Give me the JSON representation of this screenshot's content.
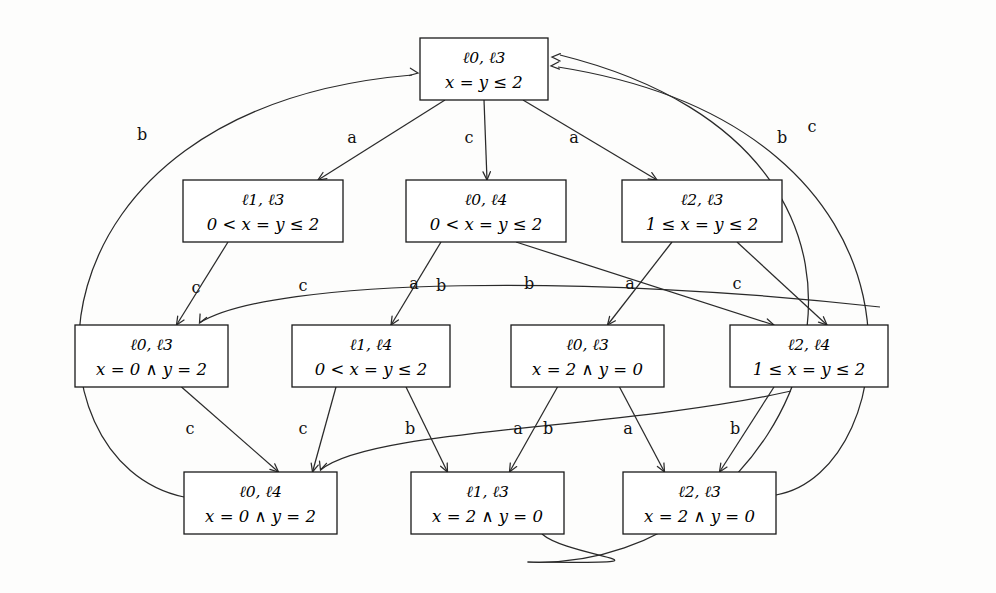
{
  "diagram": {
    "colors": {
      "line": "#2a2a2a",
      "box_stroke": "#1a1a1a",
      "background": "#ffffff",
      "text": "#000000"
    },
    "nodes": [
      {
        "id": "n0",
        "locations": "ℓ0, ℓ3",
        "constraint": "x = y ≤ 2",
        "x": 420,
        "y": 38,
        "w": 128,
        "h": 62
      },
      {
        "id": "n1",
        "locations": "ℓ1, ℓ3",
        "constraint": "0 < x = y ≤ 2",
        "x": 183,
        "y": 180,
        "w": 160,
        "h": 62
      },
      {
        "id": "n2",
        "locations": "ℓ0, ℓ4",
        "constraint": "0 < x = y ≤ 2",
        "x": 406,
        "y": 180,
        "w": 160,
        "h": 62
      },
      {
        "id": "n3",
        "locations": "ℓ2, ℓ3",
        "constraint": "1 ≤ x = y ≤ 2",
        "x": 622,
        "y": 180,
        "w": 160,
        "h": 62
      },
      {
        "id": "n4",
        "locations": "ℓ0, ℓ3",
        "constraint": "x = 0 ∧ y = 2",
        "x": 75,
        "y": 325,
        "w": 153,
        "h": 62
      },
      {
        "id": "n5",
        "locations": "ℓ1, ℓ4",
        "constraint": "0 < x = y ≤ 2",
        "x": 292,
        "y": 325,
        "w": 158,
        "h": 62
      },
      {
        "id": "n6",
        "locations": "ℓ0, ℓ3",
        "constraint": "x = 2 ∧ y = 0",
        "x": 511,
        "y": 325,
        "w": 153,
        "h": 62
      },
      {
        "id": "n7",
        "locations": "ℓ2, ℓ4",
        "constraint": "1 ≤ x = y ≤ 2",
        "x": 730,
        "y": 325,
        "w": 158,
        "h": 62
      },
      {
        "id": "n8",
        "locations": "ℓ0, ℓ4",
        "constraint": "x = 0 ∧ y = 2",
        "x": 184,
        "y": 472,
        "w": 153,
        "h": 62
      },
      {
        "id": "n9",
        "locations": "ℓ1, ℓ3",
        "constraint": "x = 2 ∧ y = 0",
        "x": 411,
        "y": 472,
        "w": 153,
        "h": 62
      },
      {
        "id": "n10",
        "locations": "ℓ2, ℓ3",
        "constraint": "x = 2 ∧ y = 0",
        "x": 623,
        "y": 472,
        "w": 153,
        "h": 62
      }
    ],
    "edge_labels": [
      {
        "id": "e_left_b",
        "label": "b",
        "x": 142,
        "y": 140
      },
      {
        "id": "e_n0_n1_a",
        "label": "a",
        "x": 352,
        "y": 143
      },
      {
        "id": "e_n0_n2_c",
        "label": "c",
        "x": 469,
        "y": 143
      },
      {
        "id": "e_n0_n3_a",
        "label": "a",
        "x": 574,
        "y": 143
      },
      {
        "id": "e_right_b",
        "label": "b",
        "x": 782,
        "y": 143
      },
      {
        "id": "e_right_c",
        "label": "c",
        "x": 812,
        "y": 132
      },
      {
        "id": "e_n1_n4_c",
        "label": "c",
        "x": 196,
        "y": 293
      },
      {
        "id": "e_arc_c",
        "label": "c",
        "x": 303,
        "y": 291
      },
      {
        "id": "e_mid_a1",
        "label": "a",
        "x": 414,
        "y": 289
      },
      {
        "id": "e_mid_b1",
        "label": "b",
        "x": 441,
        "y": 291
      },
      {
        "id": "e_mid_b2",
        "label": "b",
        "x": 529,
        "y": 289
      },
      {
        "id": "e_mid_a2",
        "label": "a",
        "x": 630,
        "y": 289
      },
      {
        "id": "e_n3_n7_c",
        "label": "c",
        "x": 737,
        "y": 289
      },
      {
        "id": "e_n4_n8_c",
        "label": "c",
        "x": 190,
        "y": 434
      },
      {
        "id": "e_n5_n8_c",
        "label": "c",
        "x": 303,
        "y": 434
      },
      {
        "id": "e_low_b1",
        "label": "b",
        "x": 410,
        "y": 434
      },
      {
        "id": "e_low_a1",
        "label": "a",
        "x": 518,
        "y": 434
      },
      {
        "id": "e_low_b2",
        "label": "b",
        "x": 548,
        "y": 434
      },
      {
        "id": "e_low_a2",
        "label": "a",
        "x": 628,
        "y": 434
      },
      {
        "id": "e_low_b3",
        "label": "b",
        "x": 735,
        "y": 434
      }
    ]
  }
}
